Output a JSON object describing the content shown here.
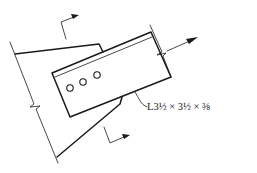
{
  "figure": {
    "type": "steel connection detail",
    "member_label": "L3½ × 3½ × ⅜",
    "bolt_count": 3,
    "colors": {
      "line": "#1a1a1a",
      "background": "#ffffff"
    }
  },
  "elements": {
    "gusset_plate": "gusset plate with break line at support",
    "angle_member": "single angle member bolted to gusset",
    "bolts": [
      "bolt-hole-1",
      "bolt-hole-2",
      "bolt-hole-3"
    ],
    "section_cut_marks": [
      "top section mark",
      "bottom section mark"
    ],
    "load_arrow": "tension force arrow"
  }
}
